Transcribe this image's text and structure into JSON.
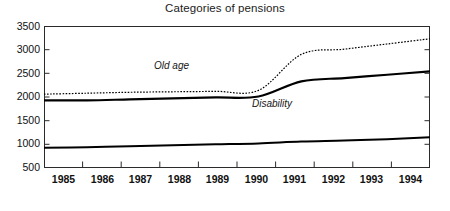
{
  "chart_data": {
    "type": "line",
    "title": "Categories of pensions",
    "xlabel": "",
    "ylabel": "",
    "grid": false,
    "legend_position": "inline-annotations",
    "x": [
      1985,
      1986,
      1987,
      1988,
      1989,
      1990,
      1991,
      1992,
      1993,
      1994
    ],
    "xlim": [
      1985,
      1994
    ],
    "ylim": [
      500,
      3500
    ],
    "ytick_labels": [
      "3500",
      "3000",
      "2500",
      "2000",
      "1500",
      "1000",
      "500"
    ],
    "yticks": [
      3500,
      3000,
      2500,
      2000,
      1500,
      1000,
      500
    ],
    "xtick_labels": [
      "1985",
      "1986",
      "1987",
      "1988",
      "1989",
      "1990",
      "1991",
      "1992",
      "1993",
      "1994"
    ],
    "series": [
      {
        "name": "Old age",
        "style": "dotted",
        "annotation": "Old age",
        "values": [
          2060,
          2080,
          2100,
          2110,
          2120,
          2140,
          2900,
          3010,
          3120,
          3230
        ]
      },
      {
        "name": "Disability",
        "style": "solid-thick",
        "annotation": "Disability",
        "values": [
          1930,
          1930,
          1950,
          1970,
          1990,
          2010,
          2330,
          2400,
          2470,
          2540
        ]
      },
      {
        "name": "Other",
        "style": "solid-thick",
        "annotation": "",
        "values": [
          930,
          940,
          960,
          980,
          1000,
          1020,
          1060,
          1080,
          1110,
          1150
        ]
      }
    ],
    "annotations": [
      {
        "text": "Old age",
        "x": 1989.0,
        "y": 2620
      },
      {
        "text": "Disability",
        "x": 1991.4,
        "y": 1820
      }
    ]
  }
}
